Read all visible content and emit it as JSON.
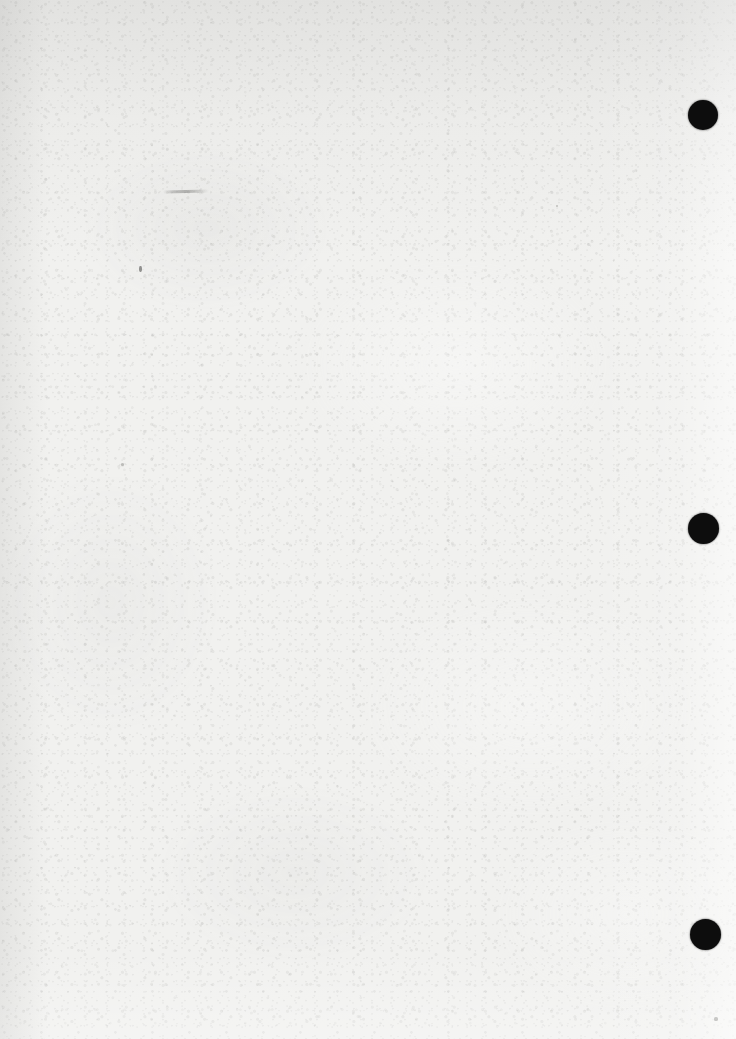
{
  "document": {
    "type": "scanned-page",
    "title": "Blank scanned page",
    "description": "Verso of a scanned paper page with no printed text, showing paper grain and three black register dots along the right margin.",
    "width_px": 736,
    "height_px": 1039,
    "background_color": "#f1f1ef",
    "text_content": ""
  },
  "colors": {
    "paper": "#f1f1ef",
    "paper_highlight": "#fafafa",
    "paper_shadow": "#e2e2e0",
    "dot": "#0d0d0d",
    "artifact": "#4a4a48"
  },
  "register_marks": {
    "label": "register-dots",
    "count": 3,
    "color": "#0d0d0d",
    "diameter_px": 30,
    "items": [
      {
        "name": "register-dot-top",
        "x": 703,
        "y": 115,
        "diameter": 30
      },
      {
        "name": "register-dot-middle",
        "x": 703,
        "y": 528,
        "diameter": 31
      },
      {
        "name": "register-dot-bottom",
        "x": 705,
        "y": 934,
        "diameter": 31
      }
    ]
  },
  "artifacts": {
    "label": "scan-artifacts",
    "items": [
      {
        "name": "pencil-streak",
        "kind": "streak",
        "x": 163,
        "y": 190,
        "width": 46,
        "height": 3
      },
      {
        "name": "ink-speck-left",
        "kind": "speck",
        "x": 139,
        "y": 266,
        "width": 3,
        "height": 6
      },
      {
        "name": "ink-speck-lower",
        "kind": "speck",
        "x": 121,
        "y": 463,
        "width": 3,
        "height": 3
      },
      {
        "name": "ink-speck-corner",
        "kind": "speck",
        "x": 714,
        "y": 1017,
        "width": 4,
        "height": 4
      },
      {
        "name": "ink-speck-midright",
        "kind": "speck",
        "x": 556,
        "y": 205,
        "width": 2,
        "height": 2
      }
    ]
  }
}
